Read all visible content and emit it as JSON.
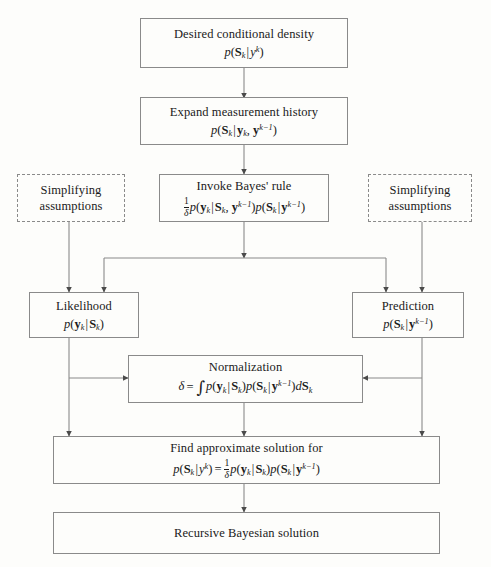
{
  "diagram": {
    "background_color": "#fdfdfb",
    "line_color": "#8a8a8a",
    "text_color": "#1a1a1a"
  },
  "nodes": {
    "desired": {
      "label": "Desired conditional density",
      "formula_plain": "p(S_k|y^k)"
    },
    "expand": {
      "label": "Expand measurement history",
      "formula_plain": "p(S_k|y_k, y^{k-1})"
    },
    "bayes": {
      "label": "Invoke Bayes' rule",
      "formula_plain": "(1/d) p(y_k|S_k, y^{k-1}) p(S_k|y^{k-1})"
    },
    "assumptions_left": {
      "label_line1": "Simplifying",
      "label_line2": "assumptions"
    },
    "assumptions_right": {
      "label_line1": "Simplifying",
      "label_line2": "assumptions"
    },
    "likelihood": {
      "label": "Likelihood",
      "formula_plain": "p(y_k|S_k)"
    },
    "prediction": {
      "label": "Prediction",
      "formula_plain": "p(S_k|y^{k-1})"
    },
    "normalization": {
      "label": "Normalization",
      "formula_plain": "d = INT p(y_k|S_k) p(S_k|y^{k-1}) dS_k"
    },
    "approximate": {
      "label": "Find approximate solution for",
      "formula_plain": "p(S_k|y^k) = (1/d) p(y_k|S_k) p(S_k|y^{k-1})"
    },
    "recursive": {
      "label": "Recursive Bayesian solution"
    }
  }
}
